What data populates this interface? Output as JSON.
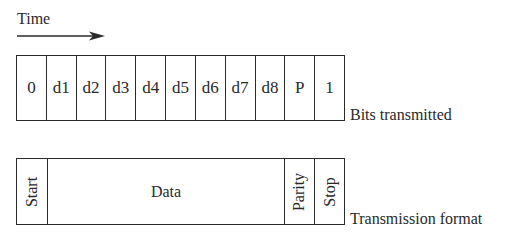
{
  "time_axis": {
    "label": "Time",
    "arrow_icon": "right-arrow-icon"
  },
  "bits_transmitted": {
    "caption": "Bits transmitted",
    "cells": [
      "0",
      "d1",
      "d2",
      "d3",
      "d4",
      "d5",
      "d6",
      "d7",
      "d8",
      "P",
      "1"
    ]
  },
  "transmission_format": {
    "caption": "Transmission format",
    "fields": {
      "start": "Start",
      "data": "Data",
      "parity": "Parity",
      "stop": "Stop"
    }
  },
  "colors": {
    "line": "#2a2a2a",
    "background": "#ffffff"
  }
}
